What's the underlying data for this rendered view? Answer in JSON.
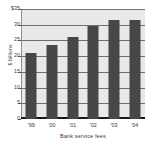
{
  "chart_data": {
    "type": "bar",
    "title": "",
    "subtitle": "",
    "xlabel": "Bank service fees",
    "ylabel": "$ billions",
    "categories": [
      "'99",
      "'00",
      "'01",
      "'02",
      "'03",
      "'04"
    ],
    "values": [
      21.0,
      23.5,
      26.0,
      29.5,
      31.5,
      31.5
    ],
    "series": [
      {
        "name": "Bank service fees",
        "values": [
          21.0,
          23.5,
          26.0,
          29.5,
          31.5,
          31.5
        ]
      }
    ],
    "ylim": [
      0,
      35
    ],
    "ytick_values": [
      0,
      5,
      10,
      15,
      20,
      25,
      30,
      35
    ],
    "ytick_labels": [
      "0",
      "5",
      "10",
      "15",
      "20",
      "25",
      "30",
      "$35"
    ],
    "grid": true,
    "grid_orientation": "horizontal",
    "legend": false,
    "legend_position": "none",
    "annotations": [],
    "colors": {
      "bar": "#474747",
      "plot_background": "#e9e9e9",
      "page_background": "#ffffff",
      "gridline": "#6f6f6f",
      "baseline": "#1a1a1a",
      "text": "#3c3c3c"
    }
  }
}
